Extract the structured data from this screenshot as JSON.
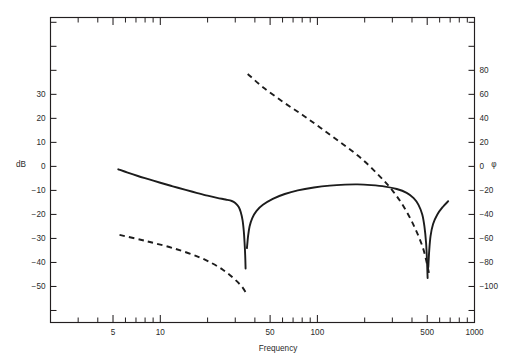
{
  "chart_data": {
    "type": "line",
    "title": "",
    "xlabel": "Frequency",
    "ylabel": "dB",
    "y2label": "φ",
    "xscale": "log",
    "xlim": [
      2,
      1000
    ],
    "ylim": [
      -65,
      62
    ],
    "y2lim": [
      -130,
      124
    ],
    "grid": false,
    "legend": "none",
    "x_ticks_labeled": [
      {
        "value": 5,
        "label": "5"
      },
      {
        "value": 10,
        "label": "10"
      },
      {
        "value": 50,
        "label": "50"
      },
      {
        "value": 100,
        "label": "100"
      },
      {
        "value": 500,
        "label": "500"
      },
      {
        "value": 1000,
        "label": "1000"
      }
    ],
    "x_ticks_minor": [
      3,
      4,
      6,
      7,
      8,
      9,
      20,
      30,
      40,
      60,
      70,
      80,
      90,
      200,
      300,
      400,
      600,
      700,
      800,
      900
    ],
    "y_ticks_labeled": [
      {
        "value": 30,
        "label": "30"
      },
      {
        "value": 20,
        "label": "20"
      },
      {
        "value": 10,
        "label": "10"
      },
      {
        "value": 0,
        "label": "0"
      },
      {
        "value": -10,
        "label": "−10"
      },
      {
        "value": -20,
        "label": "−20"
      },
      {
        "value": -30,
        "label": "−30"
      },
      {
        "value": -40,
        "label": "−40"
      },
      {
        "value": -50,
        "label": "−50"
      }
    ],
    "y_ticks_unlabeled": [
      60,
      50,
      40,
      -60
    ],
    "y2_ticks_labeled": [
      {
        "value": 80,
        "label": "80"
      },
      {
        "value": 60,
        "label": "60"
      },
      {
        "value": 40,
        "label": "40"
      },
      {
        "value": 20,
        "label": "20"
      },
      {
        "value": 0,
        "label": "0"
      },
      {
        "value": -20,
        "label": "−20"
      },
      {
        "value": -40,
        "label": "−40"
      },
      {
        "value": -60,
        "label": "−60"
      },
      {
        "value": -80,
        "label": "−80"
      },
      {
        "value": -100,
        "label": "−100"
      }
    ],
    "y2_ticks_unlabeled": [
      120,
      100,
      -120
    ],
    "series": [
      {
        "name": "Magnitude",
        "axis": "left",
        "style": "solid",
        "unit": "dB",
        "points": [
          [
            5.4,
            -1.2
          ],
          [
            6.2,
            -2.6
          ],
          [
            7.2,
            -4.0
          ],
          [
            8.5,
            -5.4
          ],
          [
            10.0,
            -6.8
          ],
          [
            12.0,
            -8.3
          ],
          [
            14.5,
            -9.8
          ],
          [
            17.0,
            -11.0
          ],
          [
            20.0,
            -12.2
          ],
          [
            23.0,
            -13.1
          ],
          [
            26.0,
            -13.8
          ],
          [
            28.5,
            -14.4
          ],
          [
            30.0,
            -15.2
          ],
          [
            31.5,
            -16.8
          ],
          [
            32.5,
            -19.0
          ],
          [
            33.4,
            -22.5
          ],
          [
            34.0,
            -27.0
          ],
          [
            34.4,
            -32.0
          ],
          [
            34.7,
            -37.0
          ],
          [
            34.9,
            -42.5
          ]
        ]
      },
      {
        "name": "Magnitude (second lobe)",
        "axis": "left",
        "style": "solid",
        "unit": "dB",
        "points": [
          [
            35.6,
            -34.0
          ],
          [
            36.2,
            -29.0
          ],
          [
            37.0,
            -25.0
          ],
          [
            38.5,
            -21.5
          ],
          [
            41.0,
            -18.5
          ],
          [
            45.0,
            -16.0
          ],
          [
            52.0,
            -13.5
          ],
          [
            62.0,
            -11.5
          ],
          [
            75.0,
            -10.0
          ],
          [
            95.0,
            -8.8
          ],
          [
            120.0,
            -8.0
          ],
          [
            150.0,
            -7.6
          ],
          [
            180.0,
            -7.5
          ],
          [
            220.0,
            -7.8
          ],
          [
            270.0,
            -8.4
          ],
          [
            320.0,
            -9.4
          ],
          [
            370.0,
            -11.0
          ],
          [
            410.0,
            -13.2
          ],
          [
            440.0,
            -16.0
          ],
          [
            465.0,
            -20.0
          ],
          [
            480.0,
            -25.0
          ],
          [
            492.0,
            -32.0
          ],
          [
            499.0,
            -40.0
          ],
          [
            503.0,
            -46.5
          ]
        ]
      },
      {
        "name": "Magnitude (tail)",
        "axis": "left",
        "style": "solid",
        "unit": "dB",
        "points": [
          [
            508.0,
            -42.0
          ],
          [
            515.0,
            -35.0
          ],
          [
            525.0,
            -29.0
          ],
          [
            545.0,
            -24.0
          ],
          [
            580.0,
            -20.0
          ],
          [
            630.0,
            -16.8
          ],
          [
            680.0,
            -14.5
          ]
        ]
      },
      {
        "name": "Phase (low band)",
        "axis": "right",
        "style": "dashed",
        "unit": "degrees",
        "points": [
          [
            5.5,
            -57.0
          ],
          [
            8.0,
            -62.0
          ],
          [
            12.0,
            -68.0
          ],
          [
            18.0,
            -76.0
          ],
          [
            25.0,
            -86.0
          ],
          [
            32.0,
            -98.0
          ],
          [
            35.0,
            -105.0
          ]
        ]
      },
      {
        "name": "Phase (high band)",
        "axis": "right",
        "style": "dashed",
        "unit": "degrees",
        "points": [
          [
            36.0,
            77.0
          ],
          [
            45.0,
            66.0
          ],
          [
            60.0,
            54.0
          ],
          [
            80.0,
            43.0
          ],
          [
            105.0,
            32.0
          ],
          [
            140.0,
            20.0
          ],
          [
            185.0,
            8.0
          ],
          [
            240.0,
            -6.0
          ],
          [
            300.0,
            -20.0
          ],
          [
            360.0,
            -35.0
          ],
          [
            420.0,
            -52.0
          ],
          [
            470.0,
            -68.0
          ],
          [
            500.0,
            -82.0
          ],
          [
            515.0,
            -90.0
          ]
        ]
      }
    ],
    "annotations": {
      "notch_frequencies_hz": [
        35,
        500
      ],
      "notch_depths_db": [
        -42.5,
        -46.5
      ],
      "passband_peak_db": -7.5
    }
  }
}
